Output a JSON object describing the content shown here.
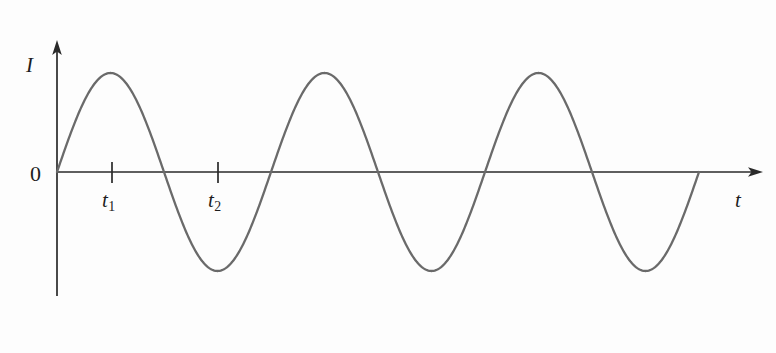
{
  "figure": {
    "title": "",
    "background_color": "#fdfdfd",
    "axis_color": "#2a2a2a",
    "curve_color": "#6a6a6a",
    "label_color": "#1d1d1d"
  },
  "labels": {
    "y_axis": "I",
    "x_axis": "t",
    "origin": "0",
    "tick1": "t",
    "tick1_sub": "1",
    "tick2": "t",
    "tick2_sub": "2"
  },
  "chart_data": {
    "type": "line",
    "title": "",
    "xlabel": "t",
    "ylabel": "I",
    "grid": false,
    "legend": "none",
    "annotations": [
      "0",
      "t1",
      "t2"
    ],
    "tick_labels": {
      "x": [
        "t1",
        "t2"
      ],
      "y": [
        "0"
      ]
    },
    "waveform": {
      "shape": "sine",
      "amplitude": 1,
      "periods_shown": 3,
      "phase": 0,
      "equation": "I = A sin(2*pi*t/T)",
      "t1_meaning": "first positive peak (quarter period)",
      "t2_meaning": "first negative trough (three-quarter period)"
    },
    "x": [
      0,
      0.125,
      0.25,
      0.375,
      0.5,
      0.625,
      0.75,
      0.875,
      1,
      1.125,
      1.25,
      1.375,
      1.5,
      1.625,
      1.75,
      1.875,
      2,
      2.125,
      2.25,
      2.375,
      2.5,
      2.625,
      2.75,
      2.875,
      3
    ],
    "values": [
      0,
      0.707,
      1,
      0.707,
      0,
      -0.707,
      -1,
      -0.707,
      0,
      0.707,
      1,
      0.707,
      0,
      -0.707,
      -1,
      -0.707,
      0,
      0.707,
      1,
      0.707,
      0,
      -0.707,
      -1,
      -0.707,
      0
    ],
    "xlim": [
      0,
      3.3
    ],
    "ylim": [
      -1.35,
      1.35
    ]
  }
}
